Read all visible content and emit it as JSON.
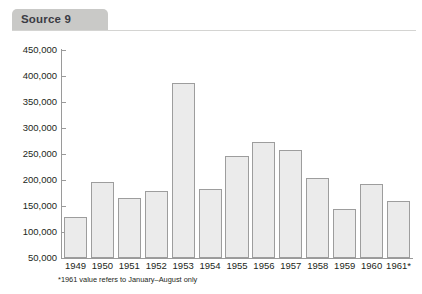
{
  "header": {
    "tab_label": "Source 9"
  },
  "footnote": "*1961 value refers to January–August only",
  "colors": {
    "tab_background": "#c9c9c7",
    "tab_text": "#3b3b44",
    "bar_fill": "#ebebeb",
    "bar_border": "#9d9d9d",
    "axis": "#9a9a9a",
    "text": "#231f20"
  },
  "chart_data": {
    "type": "bar",
    "title": "",
    "xlabel": "",
    "ylabel": "",
    "ylim": [
      50000,
      450000
    ],
    "grid": false,
    "legend": "none",
    "ytick_labels": [
      "450,000",
      "400,000",
      "350,000",
      "300,000",
      "250,000",
      "200,000",
      "150,000",
      "100,000",
      "50,000"
    ],
    "ytick_values": [
      450000,
      400000,
      350000,
      300000,
      250000,
      200000,
      150000,
      100000,
      50000
    ],
    "categories": [
      "1949",
      "1950",
      "1951",
      "1952",
      "1953",
      "1954",
      "1955",
      "1956",
      "1957",
      "1958",
      "1959",
      "1960",
      "1961*"
    ],
    "values": [
      128000,
      197000,
      165000,
      178000,
      387000,
      182000,
      246000,
      274000,
      258000,
      203000,
      144000,
      192000,
      159000
    ],
    "annotations": [
      "*1961 value refers to January–August only"
    ]
  }
}
